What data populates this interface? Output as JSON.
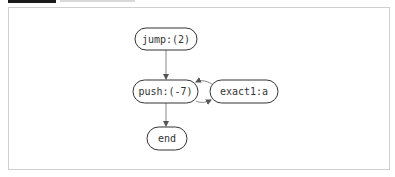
{
  "diagram": {
    "type": "flowchart",
    "nodes": [
      {
        "id": "jump",
        "label": "jump:(2)"
      },
      {
        "id": "push",
        "label": "push:(-7)"
      },
      {
        "id": "exact1",
        "label": "exact1:a"
      },
      {
        "id": "end",
        "label": "end"
      }
    ],
    "edges": [
      {
        "from": "jump",
        "to": "push"
      },
      {
        "from": "push",
        "to": "exact1"
      },
      {
        "from": "exact1",
        "to": "push"
      },
      {
        "from": "push",
        "to": "end"
      }
    ],
    "colors": {
      "node_border": "#333333",
      "node_fill": "#ffffff",
      "edge": "#888888",
      "frame_border": "#cfcfcf"
    }
  }
}
